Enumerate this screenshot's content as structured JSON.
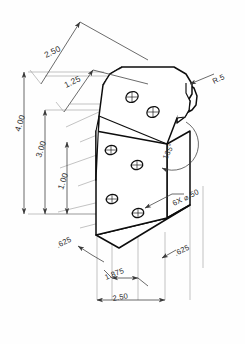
{
  "drawing": {
    "title": "Isometric Bracket Detail",
    "view_type": "isometric",
    "background_color": "#fefefe",
    "line_color": "#0d0d0d",
    "dimension_color": "#3a3a3a",
    "extension_line_color": "#9a9a9a"
  },
  "dimensions": {
    "top_outer": "2.50",
    "top_inner": "1.25",
    "left_outer": "4.00",
    "left_middle": "3.00",
    "left_inner": "1.00",
    "bottom_left_offset": ".625",
    "bottom_middle": "1.875",
    "bottom_overall": "2.50",
    "bottom_right_offset": ".625",
    "angle": "135°",
    "radius_callout": "R.5",
    "hole_callout": "6X ⌀.50"
  },
  "features": {
    "hole_count": 6,
    "hole_diameter": ".50",
    "corner_radius": ".5",
    "bend_angle": "135°"
  },
  "holes": [
    {
      "id": "hole-1",
      "cx": 132,
      "cy": 97
    },
    {
      "id": "hole-2",
      "cx": 153,
      "cy": 112
    },
    {
      "id": "hole-3",
      "cx": 111,
      "cy": 150
    },
    {
      "id": "hole-4",
      "cx": 137,
      "cy": 165
    },
    {
      "id": "hole-5",
      "cx": 112,
      "cy": 199
    },
    {
      "id": "hole-6",
      "cx": 138,
      "cy": 213
    }
  ]
}
